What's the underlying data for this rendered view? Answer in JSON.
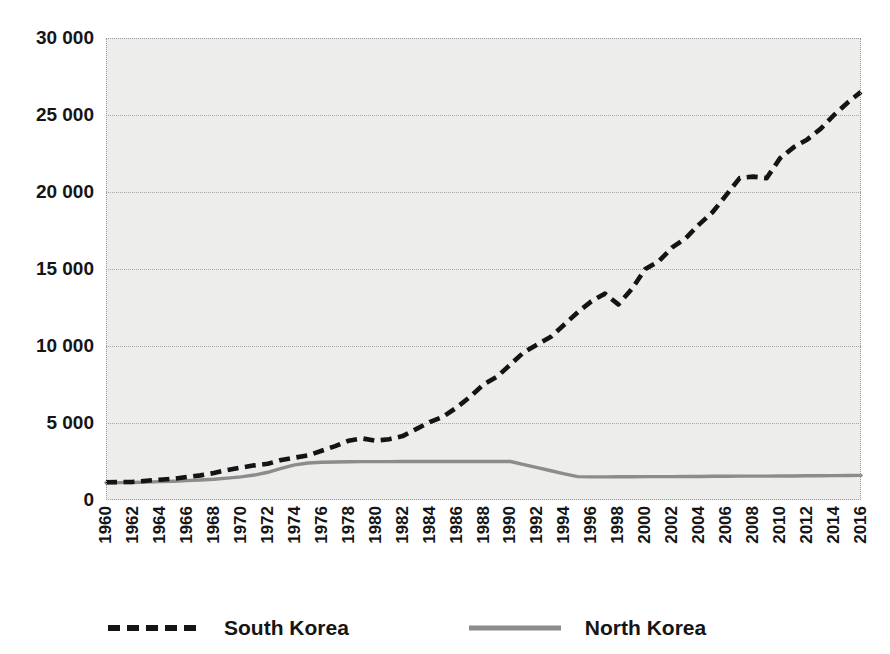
{
  "chart_data": {
    "type": "line",
    "title": "",
    "subtitle": "",
    "xlabel": "",
    "ylabel": "",
    "xlim": [
      1960,
      2016
    ],
    "ylim": [
      0,
      30000
    ],
    "grid": true,
    "legend_position": "bottom",
    "y_ticks": [
      0,
      5000,
      10000,
      15000,
      20000,
      25000,
      30000
    ],
    "y_tick_labels": [
      "0",
      "5 000",
      "10 000",
      "15 000",
      "20 000",
      "25 000",
      "30 000"
    ],
    "x_ticks": [
      1960,
      1962,
      1964,
      1966,
      1968,
      1970,
      1972,
      1974,
      1976,
      1978,
      1980,
      1982,
      1984,
      1986,
      1988,
      1990,
      1992,
      1994,
      1996,
      1998,
      2000,
      2002,
      2004,
      2006,
      2008,
      2010,
      2012,
      2014,
      2016
    ],
    "x_tick_labels": [
      "1960",
      "1962",
      "1964",
      "1966",
      "1968",
      "1970",
      "1972",
      "1974",
      "1976",
      "1978",
      "1980",
      "1982",
      "1984",
      "1986",
      "1988",
      "1990",
      "1992",
      "1994",
      "1996",
      "1998",
      "2000",
      "2002",
      "2004",
      "2006",
      "2008",
      "2010",
      "2012",
      "2014",
      "2016"
    ],
    "x": [
      1960,
      1961,
      1962,
      1963,
      1964,
      1965,
      1966,
      1967,
      1968,
      1969,
      1970,
      1971,
      1972,
      1973,
      1974,
      1975,
      1976,
      1977,
      1978,
      1979,
      1980,
      1981,
      1982,
      1983,
      1984,
      1985,
      1986,
      1987,
      1988,
      1989,
      1990,
      1991,
      1992,
      1993,
      1994,
      1995,
      1996,
      1997,
      1998,
      1999,
      2000,
      2001,
      2002,
      2003,
      2004,
      2005,
      2006,
      2007,
      2008,
      2009,
      2010,
      2011,
      2012,
      2013,
      2014,
      2015,
      2016
    ],
    "series": [
      {
        "name": "South Korea",
        "color": "#141414",
        "style": "dashed",
        "values": [
          1150,
          1160,
          1180,
          1250,
          1320,
          1380,
          1500,
          1600,
          1750,
          1950,
          2100,
          2250,
          2350,
          2600,
          2750,
          2900,
          3200,
          3500,
          3850,
          4000,
          3850,
          3950,
          4150,
          4600,
          5050,
          5400,
          6000,
          6700,
          7500,
          8000,
          8800,
          9600,
          10100,
          10600,
          11400,
          12200,
          12900,
          13400,
          12700,
          13700,
          15000,
          15500,
          16400,
          17000,
          17900,
          18700,
          19800,
          20900,
          21000,
          20900,
          22200,
          22900,
          23400,
          24100,
          25000,
          25800,
          26500
        ]
      },
      {
        "name": "North Korea",
        "color": "#8c8c8c",
        "style": "solid",
        "values": [
          1120,
          1130,
          1140,
          1160,
          1190,
          1220,
          1260,
          1300,
          1350,
          1420,
          1500,
          1620,
          1800,
          2050,
          2280,
          2400,
          2450,
          2470,
          2480,
          2490,
          2490,
          2490,
          2500,
          2500,
          2500,
          2500,
          2500,
          2500,
          2500,
          2500,
          2500,
          2300,
          2100,
          1900,
          1700,
          1520,
          1500,
          1500,
          1510,
          1510,
          1520,
          1520,
          1520,
          1530,
          1530,
          1540,
          1540,
          1550,
          1550,
          1550,
          1560,
          1560,
          1570,
          1570,
          1580,
          1590,
          1600
        ]
      }
    ]
  },
  "legend": {
    "entries": [
      {
        "label": "South Korea",
        "style": "dashed",
        "color": "#141414"
      },
      {
        "label": "North Korea",
        "style": "solid",
        "color": "#8c8c8c"
      }
    ]
  },
  "bleed_text": {
    "line1": "uth Korea",
    "line2": "ompared",
    "line3": "in"
  },
  "colors": {
    "plot_background": "#ededec",
    "page_background": "#ffffff",
    "gridline": "#a6a6a6",
    "south_korea": "#141414",
    "north_korea": "#8c8c8c",
    "text": "#151515"
  }
}
